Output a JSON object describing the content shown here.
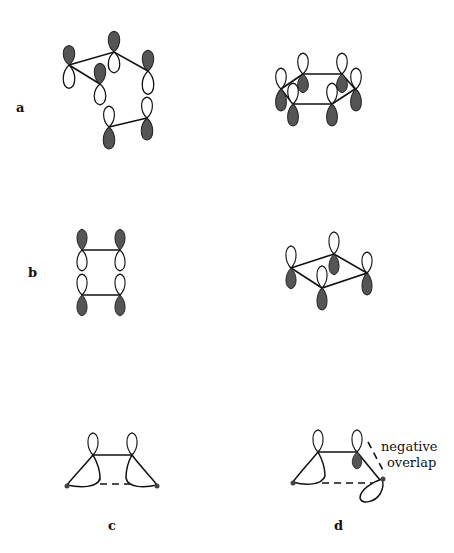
{
  "figure": {
    "panels": [
      {
        "id": "a",
        "label": "a",
        "description": "Hexagonal ring, chair-like arrangement of six p-orbitals"
      },
      {
        "id": "a2",
        "label": "",
        "description": "Hexagonal ring with six p-orbitals (boat/planar perspective)"
      },
      {
        "id": "b",
        "label": "b",
        "description": "Rectangular four-orbital arrangement, two pairs of p-orbitals"
      },
      {
        "id": "b2",
        "label": "",
        "description": "Rhombic four-orbital ring in perspective"
      },
      {
        "id": "c",
        "label": "c",
        "description": "Two p-orbitals with tilted hybrid lobes, dashed bottom interaction"
      },
      {
        "id": "d",
        "label": "d",
        "description": "As c, but one hybrid lobe inverted giving negative overlap"
      }
    ],
    "annotation": {
      "line1": "negative",
      "line2": "overlap"
    },
    "colors": {
      "shaded_lobe": "#555555",
      "line": "#111111",
      "background": "#ffffff"
    }
  }
}
